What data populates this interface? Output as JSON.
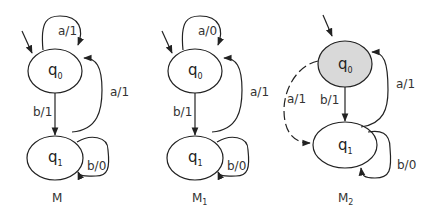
{
  "colors": {
    "stroke": "#222222",
    "highlight_fill": "#d9d9d9",
    "background": "#ffffff"
  },
  "machines": [
    {
      "name": "M",
      "name_sub": "",
      "states": [
        {
          "id": "q0",
          "base": "q",
          "sub": "0",
          "initial": true,
          "highlighted": false
        },
        {
          "id": "q1",
          "base": "q",
          "sub": "1",
          "initial": false,
          "highlighted": false
        }
      ],
      "transitions": [
        {
          "from": "q0",
          "to": "q0",
          "label": "a/1",
          "style": "solid"
        },
        {
          "from": "q0",
          "to": "q1",
          "label": "b/1",
          "style": "solid"
        },
        {
          "from": "q1",
          "to": "q0",
          "label": "a/1",
          "style": "solid"
        },
        {
          "from": "q1",
          "to": "q1",
          "label": "b/0",
          "style": "solid"
        }
      ]
    },
    {
      "name": "M",
      "name_sub": "1",
      "states": [
        {
          "id": "q0",
          "base": "q",
          "sub": "0",
          "initial": true,
          "highlighted": false
        },
        {
          "id": "q1",
          "base": "q",
          "sub": "1",
          "initial": false,
          "highlighted": false
        }
      ],
      "transitions": [
        {
          "from": "q0",
          "to": "q0",
          "label": "a/0",
          "style": "solid"
        },
        {
          "from": "q0",
          "to": "q1",
          "label": "b/1",
          "style": "solid"
        },
        {
          "from": "q1",
          "to": "q0",
          "label": "a/1",
          "style": "solid"
        },
        {
          "from": "q1",
          "to": "q1",
          "label": "b/0",
          "style": "solid"
        }
      ]
    },
    {
      "name": "M",
      "name_sub": "2",
      "states": [
        {
          "id": "q0",
          "base": "q",
          "sub": "0",
          "initial": true,
          "highlighted": true
        },
        {
          "id": "q1",
          "base": "q",
          "sub": "1",
          "initial": false,
          "highlighted": false
        }
      ],
      "transitions": [
        {
          "from": "q0",
          "to": "q1",
          "label": "a/1",
          "style": "dashed"
        },
        {
          "from": "q0",
          "to": "q1",
          "label": "b/1",
          "style": "solid"
        },
        {
          "from": "q1",
          "to": "q0",
          "label": "a/1",
          "style": "solid"
        },
        {
          "from": "q1",
          "to": "q1",
          "label": "b/0",
          "style": "solid"
        }
      ]
    }
  ]
}
